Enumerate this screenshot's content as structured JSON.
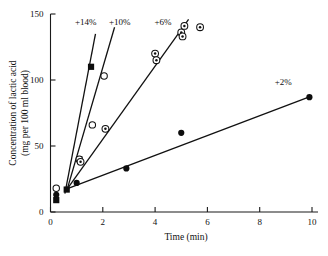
{
  "figure": {
    "background": "#ffffff",
    "ink_color": "#111111"
  },
  "chart_data": {
    "type": "scatter",
    "title": "",
    "xlabel": "Time (min)",
    "ylabel_line1": "Concentration of lactic acid",
    "ylabel_line2": "(mg per 100 ml blood)",
    "xlim": [
      0,
      10
    ],
    "ylim": [
      0,
      150
    ],
    "xticks": [
      0,
      2,
      4,
      6,
      8,
      10
    ],
    "xtick_labels": [
      "0",
      "2",
      "4",
      "6",
      "8",
      "10"
    ],
    "yticks": [
      0,
      50,
      100,
      150
    ],
    "ytick_labels": [
      "0",
      "50",
      "100",
      "150"
    ],
    "grid": false,
    "legend_position": "inline-annotations",
    "series": [
      {
        "name": "+14%",
        "label": "+14%",
        "marker": "filled-square",
        "label_x": 1.35,
        "label_y": 142,
        "points": [
          {
            "x": 0.22,
            "y": 9
          },
          {
            "x": 0.62,
            "y": 17
          },
          {
            "x": 1.1,
            "y": 40
          },
          {
            "x": 1.55,
            "y": 110
          }
        ],
        "fit_line": {
          "x1": 0.55,
          "y1": 14,
          "x2": 1.72,
          "y2": 135
        }
      },
      {
        "name": "+10%",
        "label": "+10%",
        "marker": "open-circle",
        "label_x": 2.65,
        "label_y": 142,
        "points": [
          {
            "x": 0.22,
            "y": 18
          },
          {
            "x": 1.1,
            "y": 40
          },
          {
            "x": 1.6,
            "y": 66
          },
          {
            "x": 2.05,
            "y": 103
          }
        ],
        "fit_line": {
          "x1": 0.62,
          "y1": 16,
          "x2": 2.45,
          "y2": 140
        }
      },
      {
        "name": "+6%",
        "label": "+6%",
        "marker": "circled-dot",
        "label_x": 4.3,
        "label_y": 142,
        "points": [
          {
            "x": 1.15,
            "y": 38
          },
          {
            "x": 2.1,
            "y": 63
          },
          {
            "x": 4.0,
            "y": 120
          },
          {
            "x": 4.05,
            "y": 115
          },
          {
            "x": 5.0,
            "y": 136
          },
          {
            "x": 5.05,
            "y": 133
          },
          {
            "x": 5.12,
            "y": 141
          },
          {
            "x": 5.72,
            "y": 140
          }
        ],
        "fit_line": {
          "x1": 0.62,
          "y1": 17,
          "x2": 5.28,
          "y2": 146
        }
      },
      {
        "name": "+2%",
        "label": "+2%",
        "marker": "filled-circle",
        "label_x": 8.9,
        "label_y": 96,
        "points": [
          {
            "x": 0.22,
            "y": 13
          },
          {
            "x": 1.0,
            "y": 22
          },
          {
            "x": 2.9,
            "y": 33
          },
          {
            "x": 5.0,
            "y": 60
          },
          {
            "x": 9.9,
            "y": 87
          }
        ],
        "fit_line": {
          "x1": 0.55,
          "y1": 17,
          "x2": 10.0,
          "y2": 88
        }
      }
    ]
  }
}
